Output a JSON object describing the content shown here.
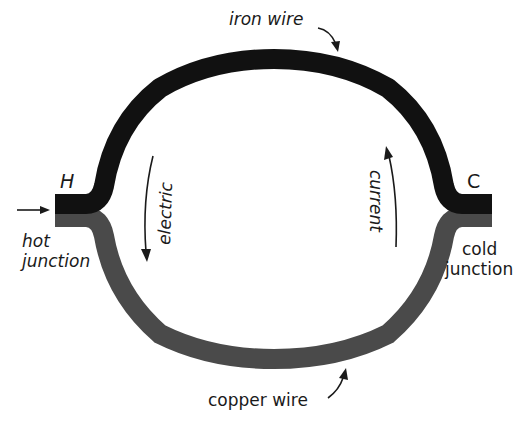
{
  "diagram": {
    "type": "thermocouple circuit",
    "colors": {
      "iron_wire": "#111111",
      "copper_wire": "#4a4a4a",
      "text": "#1a1a1a",
      "background": "#ffffff"
    },
    "labels": {
      "iron_wire": "iron wire",
      "copper_wire": "copper wire",
      "hot_junction_letter": "H",
      "cold_junction_letter": "C",
      "hot_junction_line1": "hot",
      "hot_junction_line2": "junction",
      "cold_junction_line1": "cold",
      "cold_junction_line2": "junction",
      "electric": "electric",
      "current": "current"
    }
  }
}
